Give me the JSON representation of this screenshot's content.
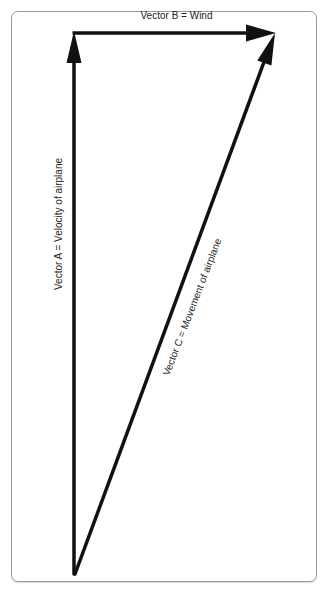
{
  "diagram": {
    "type": "vector-triangle",
    "frame": {
      "border_color": "#9a9a9a",
      "background": "#ffffff"
    },
    "stroke_color": "#111111",
    "vectors": [
      {
        "id": "A",
        "label": "Vector A = Velocity of airplane",
        "from": [
          74,
          573
        ],
        "to": [
          74,
          32
        ],
        "direction": "up"
      },
      {
        "id": "B",
        "label": "Vector B = Wind",
        "from": [
          74,
          33
        ],
        "to": [
          275,
          33
        ],
        "direction": "right"
      },
      {
        "id": "C",
        "label": "Vector C = Movement of airplane",
        "from": [
          75,
          573
        ],
        "to": [
          274,
          34
        ],
        "direction": "up-right"
      }
    ]
  },
  "labels": {
    "vector_a": "Vector A = Velocity of airplane",
    "vector_b": "Vector B = Wind",
    "vector_c": "Vector C = Movement of airplane"
  }
}
